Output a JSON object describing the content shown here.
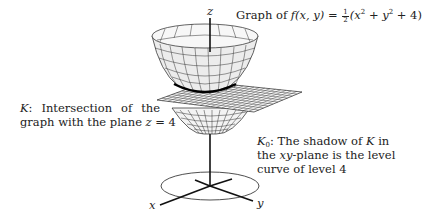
{
  "title": {
    "prefix": "Graph of ",
    "func": "f",
    "args": "(x, y)",
    "equals": " = ",
    "frac_num": "1",
    "frac_den": "2",
    "expr_open": "(x",
    "sq1": "2",
    "plus1": " + y",
    "sq2": "2",
    "tail": " + 4)"
  },
  "axes": {
    "z_label": "z",
    "x_label": "x",
    "y_label": "y"
  },
  "annotation_K": {
    "symbol": "K",
    "line1_rest": ":   Intersection   of   the",
    "line2": "graph with the plane ",
    "eq_var": "z",
    "eq_rest": " = 4"
  },
  "annotation_K0": {
    "symbol": "K",
    "sub": "0",
    "line1_rest": ":  The shadow of ",
    "line1_K": "K",
    "line1_end": " in",
    "line2_pre": "the ",
    "line2_var": "xy",
    "line2_rest": "-plane  is  the  level",
    "line3": "curve of level 4"
  },
  "colors": {
    "surface_fill": "#efefef",
    "grid_line": "#222222",
    "intersection_curve": "#000000",
    "background": "#ffffff"
  }
}
